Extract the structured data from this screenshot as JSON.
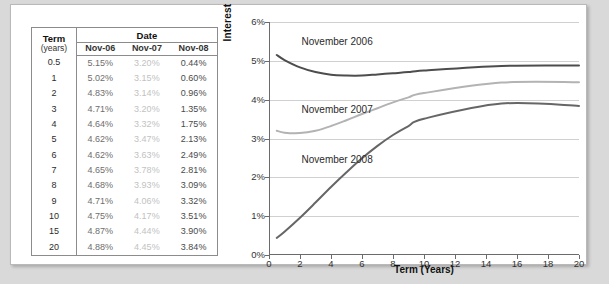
{
  "table": {
    "header": {
      "term": "Term",
      "term_units": "(years)",
      "date": "Date",
      "columns": [
        "Nov-06",
        "Nov-07",
        "Nov-08"
      ]
    },
    "rows": [
      {
        "term": "0.5",
        "values": [
          "5.15%",
          "3.20%",
          "0.44%"
        ]
      },
      {
        "term": "1",
        "values": [
          "5.02%",
          "3.15%",
          "0.60%"
        ]
      },
      {
        "term": "2",
        "values": [
          "4.83%",
          "3.14%",
          "0.96%"
        ]
      },
      {
        "term": "3",
        "values": [
          "4.71%",
          "3.20%",
          "1.35%"
        ]
      },
      {
        "term": "4",
        "values": [
          "4.64%",
          "3.32%",
          "1.75%"
        ]
      },
      {
        "term": "5",
        "values": [
          "4.62%",
          "3.47%",
          "2.13%"
        ]
      },
      {
        "term": "6",
        "values": [
          "4.62%",
          "3.63%",
          "2.49%"
        ]
      },
      {
        "term": "7",
        "values": [
          "4.65%",
          "3.78%",
          "2.81%"
        ]
      },
      {
        "term": "8",
        "values": [
          "4.68%",
          "3.93%",
          "3.09%"
        ]
      },
      {
        "term": "9",
        "values": [
          "4.71%",
          "4.06%",
          "3.32%"
        ]
      },
      {
        "term": "10",
        "values": [
          "4.75%",
          "4.17%",
          "3.51%"
        ]
      },
      {
        "term": "15",
        "values": [
          "4.87%",
          "4.44%",
          "3.90%"
        ]
      },
      {
        "term": "20",
        "values": [
          "4.88%",
          "4.45%",
          "3.84%"
        ]
      }
    ]
  },
  "chart_data": {
    "type": "line",
    "title": "",
    "xlabel": "Term (Years)",
    "ylabel": "Interest Rate (EAR)",
    "xlim": [
      0,
      20
    ],
    "ylim": [
      0,
      6
    ],
    "xticks": [
      "0",
      "2",
      "4",
      "6",
      "8",
      "10",
      "12",
      "14",
      "16",
      "18",
      "20"
    ],
    "yticks": [
      "0%",
      "1%",
      "2%",
      "3%",
      "4%",
      "5%",
      "6%"
    ],
    "grid": true,
    "legend_position": "in-plot-annotations",
    "x": [
      0.5,
      1,
      2,
      3,
      4,
      5,
      6,
      7,
      8,
      9,
      10,
      15,
      20
    ],
    "series": [
      {
        "name": "November 2006",
        "color": "#4d4d4d",
        "values": [
          5.15,
          5.02,
          4.83,
          4.71,
          4.64,
          4.62,
          4.62,
          4.65,
          4.68,
          4.71,
          4.75,
          4.87,
          4.88
        ],
        "label_x": 2.1,
        "label_y": 5.45
      },
      {
        "name": "November 2007",
        "color": "#b3b3b3",
        "values": [
          3.2,
          3.15,
          3.14,
          3.2,
          3.32,
          3.47,
          3.63,
          3.78,
          3.93,
          4.06,
          4.17,
          4.44,
          4.45
        ],
        "label_x": 2.1,
        "label_y": 3.7
      },
      {
        "name": "November 2008",
        "color": "#666666",
        "values": [
          0.44,
          0.6,
          0.96,
          1.35,
          1.75,
          2.13,
          2.49,
          2.81,
          3.09,
          3.32,
          3.51,
          3.9,
          3.84
        ],
        "label_x": 2.1,
        "label_y": 2.42
      }
    ]
  }
}
